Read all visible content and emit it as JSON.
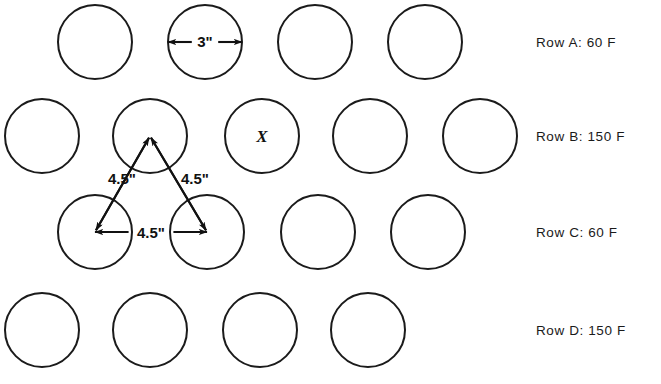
{
  "figure": {
    "kind": "engineering-layout-diagram",
    "background_color": "#ffffff",
    "line_color": "#1b1b1b",
    "width": 661,
    "height": 384
  },
  "circle_layout": {
    "radius": 37,
    "stroke_width": 2.0,
    "rows": [
      {
        "id": "A",
        "label": "Row A: 60 F",
        "center_y": 42,
        "centers_x": [
          95,
          205,
          315,
          425
        ],
        "count": 4
      },
      {
        "id": "B",
        "label": "Row B: 150 F",
        "center_y": 136,
        "centers_x": [
          42,
          150,
          262,
          370,
          480
        ],
        "count": 5
      },
      {
        "id": "C",
        "label": "Row C: 60 F",
        "center_y": 232,
        "centers_x": [
          95,
          207,
          318,
          428
        ],
        "count": 4
      },
      {
        "id": "D",
        "label": "Row D: 150 F",
        "center_y": 330,
        "centers_x": [
          42,
          150,
          260,
          368
        ],
        "count": 4
      }
    ]
  },
  "row_labels": [
    {
      "text": "Row A: 60 F",
      "x": 536,
      "y": 35
    },
    {
      "text": "Row B: 150 F",
      "x": 536,
      "y": 129
    },
    {
      "text": "Row C: 60 F",
      "x": 536,
      "y": 225
    },
    {
      "text": "Row D: 150 F",
      "x": 536,
      "y": 323
    }
  ],
  "dimensions": [
    {
      "name": "diameter-3in",
      "text": "3\"",
      "label_x": 205,
      "label_y": 47,
      "font_size": 15,
      "style": "double-arrow-horizontal",
      "from": [
        168,
        42
      ],
      "to": [
        242,
        42
      ]
    },
    {
      "name": "spacing-left-4p5in",
      "text": "4.5\"",
      "label_x": 122,
      "label_y": 184,
      "font_size": 15,
      "style": "arrow-diagonal",
      "from": [
        150,
        136
      ],
      "to": [
        95,
        232
      ]
    },
    {
      "name": "spacing-right-4p5in",
      "text": "4.5\"",
      "label_x": 195,
      "label_y": 184,
      "font_size": 15,
      "style": "arrow-diagonal",
      "from": [
        150,
        136
      ],
      "to": [
        207,
        232
      ]
    },
    {
      "name": "spacing-horizontal-4p5in",
      "text": "4.5\"",
      "label_x": 151,
      "label_y": 238,
      "font_size": 15,
      "style": "double-arrow-horizontal",
      "from": [
        95,
        232
      ],
      "to": [
        207,
        232
      ]
    }
  ],
  "markers": [
    {
      "name": "x-marker",
      "text": "X",
      "x": 262,
      "y": 142,
      "font_size": 17,
      "row": "B",
      "circle_index": 2
    }
  ]
}
